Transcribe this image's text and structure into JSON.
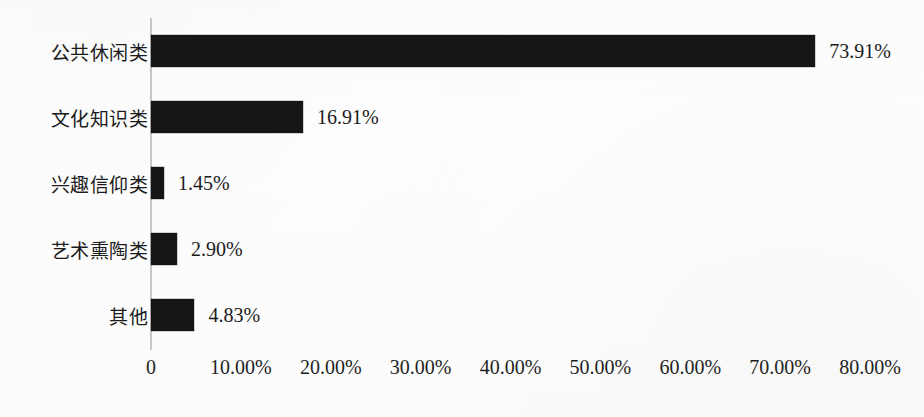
{
  "chart_data": {
    "type": "bar",
    "orientation": "horizontal",
    "title": "",
    "subtitle": "",
    "xlabel": "",
    "ylabel": "",
    "categories": [
      "公共休闲类",
      "文化知识类",
      "兴趣信仰类",
      "艺术熏陶类",
      "其他"
    ],
    "values": [
      73.91,
      16.91,
      1.45,
      2.9,
      4.83
    ],
    "value_labels": [
      "73.91%",
      "16.91%",
      "1.45%",
      "2.90%",
      "4.83%"
    ],
    "xlim": [
      0,
      80
    ],
    "xtick_values": [
      0,
      10,
      20,
      30,
      40,
      50,
      60,
      70,
      80
    ],
    "xtick_labels": [
      "0",
      "10.00%",
      "20.00%",
      "30.00%",
      "40.00%",
      "50.00%",
      "60.00%",
      "70.00%",
      "80.00%"
    ],
    "grid": false,
    "legend": null,
    "legend_position": "none",
    "bar_color": "#151515",
    "axis_color": "#c9c9c9",
    "background_color": "#fefefe",
    "text_color": "#1b1b1b",
    "annotations": []
  },
  "bars": [
    {
      "label": "公共休闲类",
      "value": 73.91,
      "value_label": "73.91%"
    },
    {
      "label": "文化知识类",
      "value": 16.91,
      "value_label": "16.91%"
    },
    {
      "label": "兴趣信仰类",
      "value": 1.45,
      "value_label": "1.45%"
    },
    {
      "label": "艺术熏陶类",
      "value": 2.9,
      "value_label": "2.90%"
    },
    {
      "label": "其他",
      "value": 4.83,
      "value_label": "4.83%"
    }
  ],
  "xticks": [
    {
      "label": "0",
      "value": 0
    },
    {
      "label": "10.00%",
      "value": 10
    },
    {
      "label": "20.00%",
      "value": 20
    },
    {
      "label": "30.00%",
      "value": 30
    },
    {
      "label": "40.00%",
      "value": 40
    },
    {
      "label": "50.00%",
      "value": 50
    },
    {
      "label": "60.00%",
      "value": 60
    },
    {
      "label": "70.00%",
      "value": 70
    },
    {
      "label": "80.00%",
      "value": 80
    }
  ]
}
